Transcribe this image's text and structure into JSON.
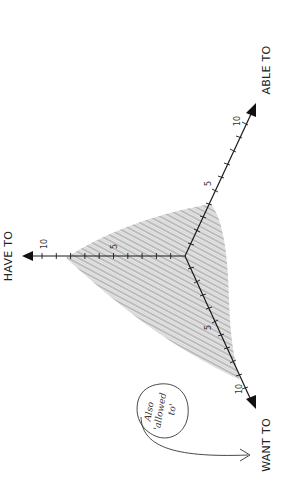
{
  "diagram": {
    "type": "triangular radar diagram (rotated 90°)",
    "origin": [
      185,
      256
    ],
    "unit_px": 14.3,
    "axes": [
      {
        "id": "have",
        "label": "HAVE TO",
        "tick_labels": [
          "5",
          "10"
        ],
        "max": 10
      },
      {
        "id": "able",
        "label": "ABLE TO",
        "tick_labels": [
          "5",
          "10"
        ],
        "max": 10
      },
      {
        "id": "want",
        "label": "WANT TO",
        "tick_labels": [
          "5",
          "10"
        ],
        "max": 10
      }
    ],
    "shaded_region": {
      "description": "hatched gray area spanning mostly HAVE TO and WANT TO, small ABLE TO",
      "approx_values": {
        "HAVE TO": 8,
        "ABLE TO": 4,
        "WANT TO": 8.5
      },
      "color": "#bdbdbd"
    },
    "annotation": {
      "lines": [
        "Also",
        "'allowed",
        "to'"
      ],
      "points_to": "WANT TO"
    }
  },
  "colors": {
    "axis": "#1a1a1a",
    "hatch": "#bdbdbd",
    "background": "#ffffff"
  }
}
